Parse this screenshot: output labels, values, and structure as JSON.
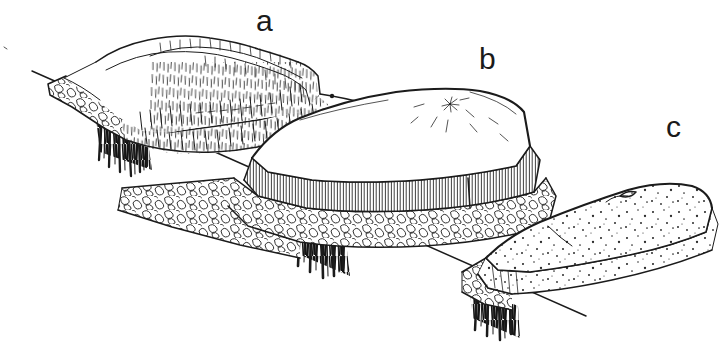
{
  "figure": {
    "style": "black ink line art on white background",
    "background_color": "#ffffff",
    "ink_color": "#1b1b1b",
    "width": 726,
    "height": 351
  },
  "labels": [
    {
      "id": "a",
      "text": "a",
      "x": 258,
      "y": 8,
      "describes": "upper-left block, dissected upland with fine vertical hachure slopes"
    },
    {
      "id": "b",
      "text": "b",
      "x": 481,
      "y": 46,
      "describes": "middle block, flat-topped mesa capped on conglomerate bench"
    },
    {
      "id": "c",
      "text": "c",
      "x": 668,
      "y": 114,
      "describes": "lower-right block, low stippled sandstone ridge"
    }
  ],
  "blocks": [
    {
      "id": "a",
      "name": "block-a",
      "label": "a",
      "position": "upper left",
      "surface_texture": "fine vertical hachure / hairline shading",
      "edge_layer": "cobble conglomerate band along the left and front cut face",
      "base_shading": "dense dark vertical hatching hanging below the front-left corner"
    },
    {
      "id": "b",
      "name": "block-b",
      "label": "b",
      "position": "middle",
      "surface_texture": "smooth plateau top with a small radiating burst mark",
      "edge_layer": "vertical-ruled cliff band over a thick cobble conglomerate bench",
      "base_shading": "dense dark vertical hatching hanging below the front-left corner"
    },
    {
      "id": "c",
      "name": "block-c",
      "label": "c",
      "position": "lower right",
      "surface_texture": "stippled / dotted sandstone surface",
      "edge_layer": "short ruled cliff with a small cobble conglomerate lens at the left end",
      "base_shading": "dense dark vertical hatching hanging below the left corner"
    }
  ],
  "ground_line": {
    "name": "ground-baseline",
    "description": "Single long straight rule descending from upper left to lower right, passing beneath all three blocks.",
    "start": {
      "x": 32,
      "y": 71
    },
    "end": {
      "x": 586,
      "y": 316
    }
  },
  "textures": {
    "hachure": "fine short vertical strokes indicating grass or erosional slope",
    "cobble": "rounded polygon outlines indicating conglomerate / cobble bed",
    "ruled_cliff": "closely spaced vertical lines indicating a bedrock cliff face",
    "stipple": "scattered dots indicating sandstone",
    "dark_hatch": "heavy black vertical strokes indicating the shaded cut-away base"
  }
}
